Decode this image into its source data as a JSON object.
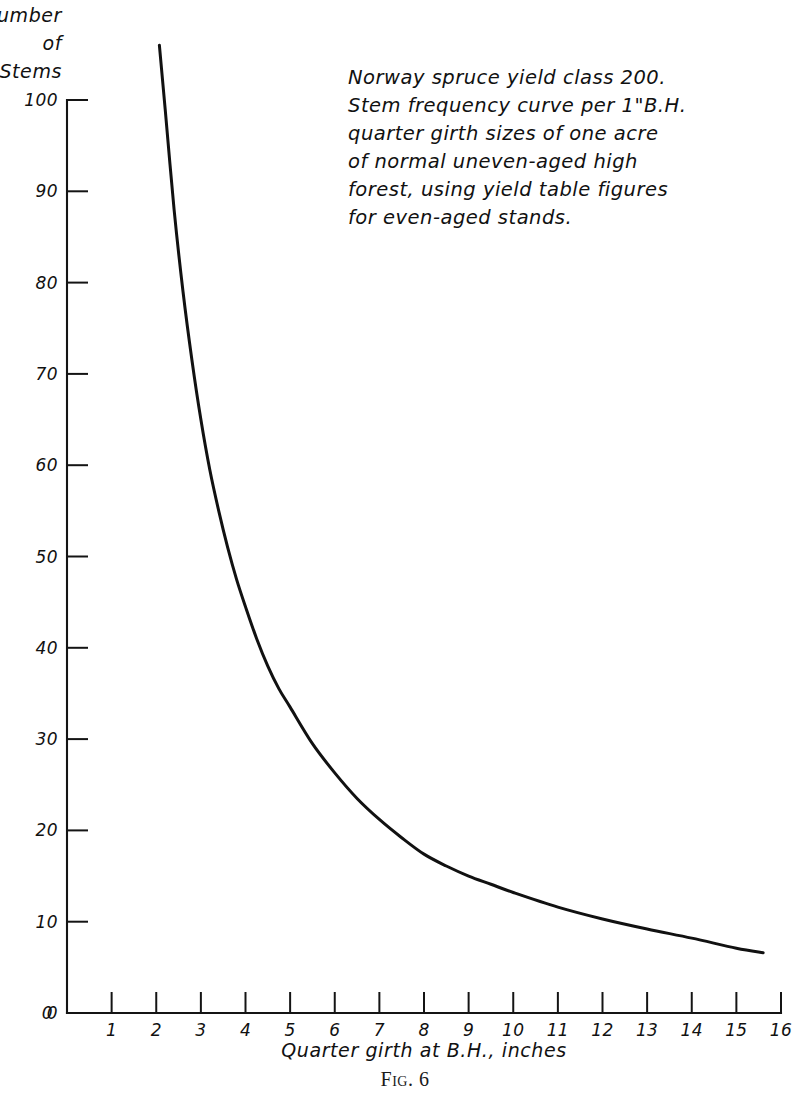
{
  "figure": {
    "caption": "Fig. 6"
  },
  "chart_data": {
    "type": "line",
    "title": "",
    "xlabel": "Quarter girth at B.H., inches",
    "ylabel": "Number of Stems",
    "ylabel_lines": [
      "Number",
      "of",
      "Stems"
    ],
    "xlim": [
      0,
      16
    ],
    "ylim": [
      0,
      100
    ],
    "grid": false,
    "legend": "none",
    "xticks": [
      0,
      1,
      2,
      3,
      4,
      5,
      6,
      7,
      8,
      9,
      10,
      11,
      12,
      13,
      14,
      15,
      16
    ],
    "xtick_labels": [
      "0",
      "1",
      "2",
      "3",
      "4",
      "5",
      "6",
      "7",
      "8",
      "9",
      "10",
      "11",
      "12",
      "13",
      "14",
      "15",
      "16"
    ],
    "yticks": [
      0,
      10,
      20,
      30,
      40,
      50,
      60,
      70,
      80,
      90,
      100
    ],
    "ytick_labels": [
      "0",
      "10",
      "20",
      "30",
      "40",
      "50",
      "60",
      "70",
      "80",
      "90",
      "100"
    ],
    "series": [
      {
        "name": "Stem frequency per 1 inch quarter girth class",
        "x": [
          2.07,
          2.2,
          2.4,
          2.6,
          2.8,
          3.0,
          3.2,
          3.4,
          3.6,
          3.8,
          4.0,
          4.25,
          4.5,
          4.75,
          5.0,
          5.5,
          6.0,
          6.5,
          7.0,
          7.5,
          8.0,
          8.5,
          9.0,
          9.5,
          10.0,
          11.0,
          12.0,
          13.0,
          14.0,
          15.0,
          15.6
        ],
        "y": [
          106.0,
          99.0,
          88.0,
          79.0,
          71.5,
          65.0,
          59.5,
          55.0,
          51.0,
          47.5,
          44.5,
          41.0,
          38.0,
          35.5,
          33.5,
          29.5,
          26.3,
          23.5,
          21.2,
          19.2,
          17.4,
          16.1,
          15.0,
          14.1,
          13.2,
          11.6,
          10.3,
          9.2,
          8.2,
          7.1,
          6.6
        ]
      }
    ],
    "annotation": {
      "lines": [
        "Norway spruce yield class 200.",
        "Stem frequency curve per 1\"B.H.",
        "quarter girth sizes of one acre",
        "of normal uneven-aged high",
        "forest, using yield table figures",
        "for even-aged stands."
      ]
    },
    "colors": {
      "curve": "#111111",
      "axis": "#141414",
      "background": "#ffffff"
    }
  }
}
